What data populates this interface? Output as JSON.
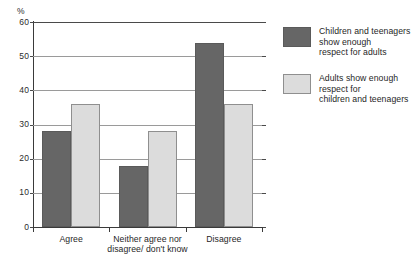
{
  "chart_data": {
    "type": "bar",
    "title": "",
    "subtitle": "",
    "xlabel": "",
    "ylabel": "%",
    "ylim": [
      0,
      60
    ],
    "ytick_step": 10,
    "ytick_labels": [
      "0",
      "10",
      "20",
      "30",
      "40",
      "50",
      "60"
    ],
    "grid": true,
    "legend_position": "right",
    "categories": [
      "Agree",
      "Neither agree\nnor disagree/\ndon't know",
      "Disagree"
    ],
    "series": [
      {
        "name": "Children and teenagers\nshow enough\nrespect for adults",
        "color": "#666666",
        "values": [
          28,
          18,
          54
        ]
      },
      {
        "name": "Adults show enough\nrespect for\nchildren and teenagers",
        "color": "#dcdcdc",
        "values": [
          36,
          28,
          36
        ]
      }
    ]
  },
  "axis": {
    "unit_label": "%"
  },
  "colors": {
    "series_dark": "#666666",
    "series_light": "#dcdcdc",
    "gridline": "#9a9a9a",
    "axis": "#3a3a3a",
    "background": "#ffffff"
  }
}
